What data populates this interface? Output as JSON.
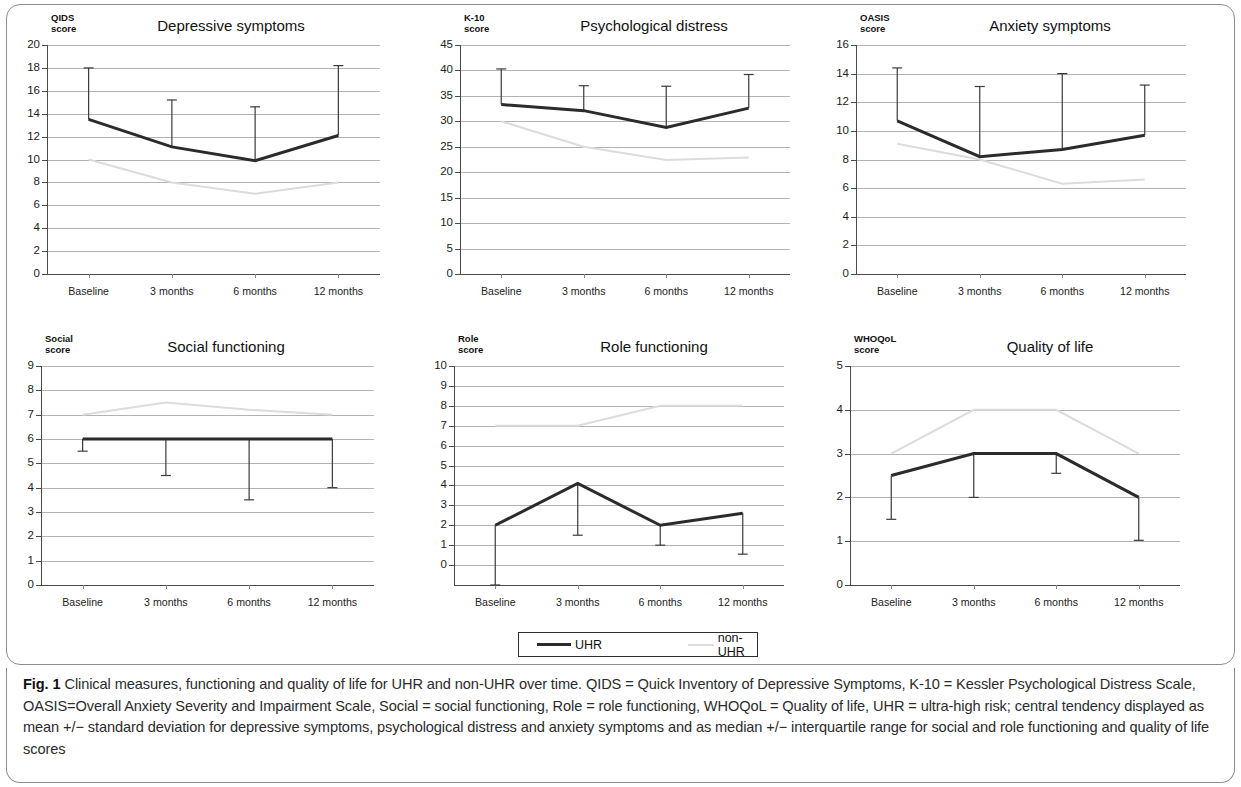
{
  "figure": {
    "legend": {
      "uhr_label": "UHR",
      "non_uhr_label": "non-UHR",
      "uhr_color": "#2b2b2b",
      "non_uhr_color": "#dcdcdc"
    },
    "caption_prefix": "Fig. 1",
    "caption_text": " Clinical measures, functioning and quality of life for UHR and non-UHR over time. QIDS = Quick Inventory of Depressive Symptoms, K-10 = Kessler Psychological Distress Scale, OASIS=Overall Anxiety Severity and Impairment Scale, Social = social functioning, Role = role functioning, WHOQoL = Quality of life, UHR = ultra-high risk; central tendency displayed as mean +/− standard deviation for depressive symptoms, psychological distress and anxiety symptoms and as median +/− interquartile range for social and role functioning and quality of life scores"
  },
  "chart_data": [
    {
      "id": "depressive-symptoms",
      "type": "line",
      "title": "Depressive symptoms",
      "ylabel": "QIDS\nscore",
      "xlabel": "",
      "categories": [
        "Baseline",
        "3 months",
        "6 months",
        "12 months"
      ],
      "ylim": [
        0,
        20
      ],
      "yticks": [
        0,
        2,
        4,
        6,
        8,
        10,
        12,
        14,
        16,
        18,
        20
      ],
      "grid": true,
      "series": [
        {
          "name": "UHR",
          "values": [
            13.5,
            11.1,
            9.9,
            12.1
          ],
          "err_low": [
            13.5,
            11.1,
            9.9,
            12.1
          ],
          "err_high": [
            18.0,
            15.2,
            14.6,
            18.2
          ]
        },
        {
          "name": "non-UHR",
          "values": [
            10.0,
            8.0,
            7.0,
            8.0
          ]
        }
      ]
    },
    {
      "id": "psychological-distress",
      "type": "line",
      "title": "Psychological distress",
      "ylabel": "K-10\nscore",
      "xlabel": "",
      "categories": [
        "Baseline",
        "3 months",
        "6 months",
        "12 months"
      ],
      "ylim": [
        0,
        45
      ],
      "yticks": [
        0,
        5,
        10,
        15,
        20,
        25,
        30,
        35,
        40,
        45
      ],
      "grid": true,
      "series": [
        {
          "name": "UHR",
          "values": [
            33.3,
            32.1,
            28.8,
            32.6
          ],
          "err_low": [
            33.3,
            32.1,
            28.8,
            32.6
          ],
          "err_high": [
            40.3,
            37.0,
            36.9,
            39.2
          ]
        },
        {
          "name": "non-UHR",
          "values": [
            30.0,
            25.0,
            22.4,
            22.9
          ]
        }
      ]
    },
    {
      "id": "anxiety-symptoms",
      "type": "line",
      "title": "Anxiety symptoms",
      "ylabel": "OASIS\nscore",
      "xlabel": "",
      "categories": [
        "Baseline",
        "3 months",
        "6 months",
        "12 months"
      ],
      "ylim": [
        0,
        16
      ],
      "yticks": [
        0,
        2,
        4,
        6,
        8,
        10,
        12,
        14,
        16
      ],
      "grid": true,
      "series": [
        {
          "name": "UHR",
          "values": [
            10.7,
            8.2,
            8.7,
            9.7
          ],
          "err_low": [
            10.7,
            8.2,
            8.7,
            9.7
          ],
          "err_high": [
            14.4,
            13.1,
            14.0,
            13.2
          ]
        },
        {
          "name": "non-UHR",
          "values": [
            9.1,
            8.0,
            6.3,
            6.6
          ]
        }
      ]
    },
    {
      "id": "social-functioning",
      "type": "line",
      "title": "Social functioning",
      "ylabel": "Social\nscore",
      "xlabel": "",
      "categories": [
        "Baseline",
        "3 months",
        "6 months",
        "12 months"
      ],
      "ylim": [
        0,
        9
      ],
      "yticks": [
        0,
        1,
        2,
        3,
        4,
        5,
        6,
        7,
        8,
        9
      ],
      "grid": true,
      "series": [
        {
          "name": "UHR",
          "values": [
            6.0,
            6.0,
            6.0,
            6.0
          ],
          "err_low": [
            5.5,
            4.5,
            3.5,
            4.0
          ],
          "err_high": [
            6.0,
            6.0,
            6.0,
            6.0
          ]
        },
        {
          "name": "non-UHR",
          "values": [
            7.0,
            7.5,
            7.2,
            7.0
          ]
        }
      ]
    },
    {
      "id": "role-functioning",
      "type": "line",
      "title": "Role functioning",
      "ylabel": "Role\nscore",
      "xlabel": "",
      "categories": [
        "Baseline",
        "3 months",
        "6 months",
        "12 months"
      ],
      "ylim": [
        -1,
        10
      ],
      "yticks": [
        0,
        1,
        2,
        3,
        4,
        5,
        6,
        7,
        8,
        9,
        10
      ],
      "grid": true,
      "series": [
        {
          "name": "UHR",
          "values": [
            2.0,
            4.1,
            2.0,
            2.6
          ],
          "err_low": [
            -1.0,
            1.5,
            1.0,
            0.55
          ],
          "err_high": [
            2.0,
            4.1,
            2.0,
            2.6
          ]
        },
        {
          "name": "non-UHR",
          "values": [
            7.0,
            7.0,
            8.0,
            8.0
          ]
        }
      ]
    },
    {
      "id": "quality-of-life",
      "type": "line",
      "title": "Quality of life",
      "ylabel": "WHOQoL\nscore",
      "xlabel": "",
      "categories": [
        "Baseline",
        "3 months",
        "6 months",
        "12 months"
      ],
      "ylim": [
        0,
        5
      ],
      "yticks": [
        0,
        1,
        2,
        3,
        4,
        5
      ],
      "grid": true,
      "series": [
        {
          "name": "UHR",
          "values": [
            2.5,
            3.0,
            3.0,
            2.0
          ],
          "err_low": [
            1.5,
            2.0,
            2.55,
            1.02
          ],
          "err_high": [
            2.5,
            3.0,
            3.0,
            2.0
          ]
        },
        {
          "name": "non-UHR",
          "values": [
            3.0,
            4.0,
            4.0,
            3.0
          ]
        }
      ]
    }
  ]
}
